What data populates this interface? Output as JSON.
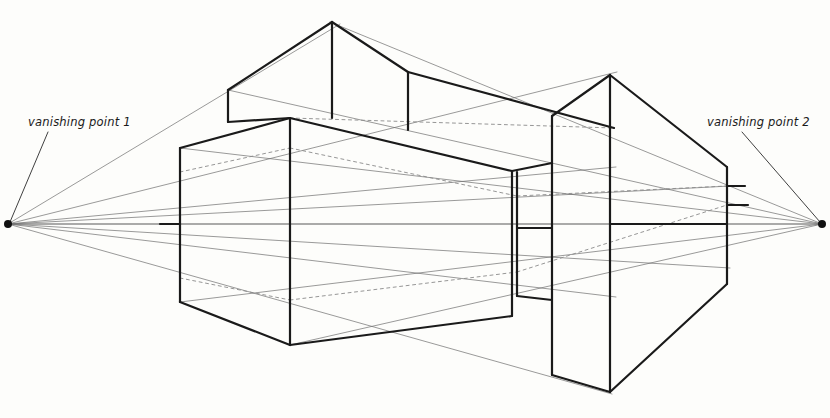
{
  "canvas": {
    "width": 830,
    "height": 418,
    "background_color": "#fdfdfb"
  },
  "style": {
    "ink_color": "#1a1a1a",
    "guide_color": "#6e6e6e",
    "hidden_color": "#8a8a8a",
    "solid_stroke_width": 2.2,
    "guide_stroke_width": 0.7,
    "hidden_stroke_width": 0.8
  },
  "labels": {
    "left": {
      "text": "vanishing point 1",
      "x": 28,
      "y": 126
    },
    "right": {
      "text": "vanishing point 2",
      "x": 707,
      "y": 126
    }
  },
  "vanishing_points": {
    "left": {
      "name": "vanishing point 1",
      "x": 8,
      "y": 224,
      "dot_radius": 4
    },
    "right": {
      "name": "vanishing point 2",
      "x": 822,
      "y": 224,
      "dot_radius": 4
    }
  },
  "leader_lines": [
    {
      "name": "left-label-leader",
      "x1": 48,
      "y1": 132,
      "x2": 10,
      "y2": 222
    },
    {
      "name": "right-label-leader",
      "x1": 742,
      "y1": 132,
      "x2": 820,
      "y2": 222
    }
  ],
  "guide_lines_left": [
    {
      "x1": 8,
      "y1": 224,
      "x2": 340,
      "y2": 24
    },
    {
      "x1": 8,
      "y1": 224,
      "x2": 617,
      "y2": 72
    },
    {
      "x1": 8,
      "y1": 224,
      "x2": 616,
      "y2": 167
    },
    {
      "x1": 8,
      "y1": 224,
      "x2": 730,
      "y2": 186
    },
    {
      "x1": 8,
      "y1": 224,
      "x2": 822,
      "y2": 224
    },
    {
      "x1": 8,
      "y1": 224,
      "x2": 730,
      "y2": 268
    },
    {
      "x1": 8,
      "y1": 224,
      "x2": 616,
      "y2": 297
    },
    {
      "x1": 8,
      "y1": 224,
      "x2": 612,
      "y2": 394
    }
  ],
  "guide_lines_right": [
    {
      "x1": 822,
      "y1": 224,
      "x2": 330,
      "y2": 22
    },
    {
      "x1": 822,
      "y1": 224,
      "x2": 228,
      "y2": 90
    },
    {
      "x1": 822,
      "y1": 224,
      "x2": 180,
      "y2": 148
    },
    {
      "x1": 822,
      "y1": 224,
      "x2": 8,
      "y2": 224
    },
    {
      "x1": 822,
      "y1": 224,
      "x2": 180,
      "y2": 302
    },
    {
      "x1": 822,
      "y1": 224,
      "x2": 290,
      "y2": 345
    }
  ],
  "solid_edges": [
    {
      "name": "upper-block-left-ridge",
      "x1": 228,
      "y1": 90,
      "x2": 332,
      "y2": 22
    },
    {
      "name": "upper-block-right-ridge",
      "x1": 332,
      "y1": 22,
      "x2": 408,
      "y2": 72
    },
    {
      "name": "upper-block-ridge-far",
      "x1": 408,
      "y1": 72,
      "x2": 614,
      "y2": 128
    },
    {
      "name": "upper-block-left-vertical",
      "x1": 228,
      "y1": 90,
      "x2": 228,
      "y2": 122
    },
    {
      "name": "upper-block-apex-vertical",
      "x1": 332,
      "y1": 22,
      "x2": 332,
      "y2": 118
    },
    {
      "name": "upper-block-right-vertical",
      "x1": 408,
      "y1": 72,
      "x2": 408,
      "y2": 130
    },
    {
      "name": "upper-block-lower-left-edge",
      "x1": 228,
      "y1": 122,
      "x2": 290,
      "y2": 118
    },
    {
      "name": "upper-block-base-left",
      "x1": 180,
      "y1": 148,
      "x2": 290,
      "y2": 118
    },
    {
      "name": "upper-block-base-right",
      "x1": 290,
      "y1": 118,
      "x2": 512,
      "y2": 171
    },
    {
      "name": "main-block-left-vertical",
      "x1": 180,
      "y1": 148,
      "x2": 180,
      "y2": 302
    },
    {
      "name": "main-block-front-vertical",
      "x1": 290,
      "y1": 118,
      "x2": 290,
      "y2": 345
    },
    {
      "name": "main-block-right-vertical",
      "x1": 512,
      "y1": 171,
      "x2": 512,
      "y2": 316
    },
    {
      "name": "main-block-bottom-left",
      "x1": 180,
      "y1": 302,
      "x2": 290,
      "y2": 345
    },
    {
      "name": "main-block-bottom-right",
      "x1": 290,
      "y1": 345,
      "x2": 512,
      "y2": 316
    },
    {
      "name": "connector-left-vertical",
      "x1": 517,
      "y1": 172,
      "x2": 517,
      "y2": 296
    },
    {
      "name": "connector-mid-horizontal",
      "x1": 517,
      "y1": 228,
      "x2": 552,
      "y2": 228
    },
    {
      "name": "connector-top-edge",
      "x1": 512,
      "y1": 171,
      "x2": 552,
      "y2": 163
    },
    {
      "name": "connector-bottom-edge",
      "x1": 517,
      "y1": 296,
      "x2": 552,
      "y2": 300
    },
    {
      "name": "right-block-top-ridge-left",
      "x1": 552,
      "y1": 116,
      "x2": 610,
      "y2": 75
    },
    {
      "name": "right-block-top-ridge-right",
      "x1": 610,
      "y1": 75,
      "x2": 727,
      "y2": 167
    },
    {
      "name": "right-block-left-vertical",
      "x1": 552,
      "y1": 116,
      "x2": 552,
      "y2": 375
    },
    {
      "name": "right-block-front-vertical",
      "x1": 610,
      "y1": 75,
      "x2": 610,
      "y2": 392
    },
    {
      "name": "right-block-right-vertical",
      "x1": 727,
      "y1": 167,
      "x2": 727,
      "y2": 284
    },
    {
      "name": "right-block-bottom-left",
      "x1": 552,
      "y1": 375,
      "x2": 610,
      "y2": 392
    },
    {
      "name": "right-block-bottom-right",
      "x1": 610,
      "y1": 392,
      "x2": 727,
      "y2": 284
    },
    {
      "name": "right-block-tick-upper",
      "x1": 727,
      "y1": 186,
      "x2": 745,
      "y2": 186
    },
    {
      "name": "right-block-tick-lower",
      "x1": 727,
      "y1": 205,
      "x2": 748,
      "y2": 205
    },
    {
      "name": "right-block-center-horizontal",
      "x1": 610,
      "y1": 224,
      "x2": 727,
      "y2": 224
    },
    {
      "name": "left-tick-upper",
      "x1": 160,
      "y1": 224,
      "x2": 180,
      "y2": 224
    }
  ],
  "hidden_edges": [
    {
      "name": "hidden-top-back-left",
      "x1": 180,
      "y1": 172,
      "x2": 290,
      "y2": 148
    },
    {
      "name": "hidden-top-back-right",
      "x1": 290,
      "y1": 148,
      "x2": 517,
      "y2": 196
    },
    {
      "name": "hidden-top-back-extend",
      "x1": 517,
      "y1": 196,
      "x2": 727,
      "y2": 186
    },
    {
      "name": "hidden-bottom-back-left",
      "x1": 180,
      "y1": 278,
      "x2": 290,
      "y2": 300
    },
    {
      "name": "hidden-bottom-back-right",
      "x1": 290,
      "y1": 300,
      "x2": 517,
      "y2": 272
    },
    {
      "name": "hidden-bottom-back-extend",
      "x1": 517,
      "y1": 272,
      "x2": 727,
      "y2": 205
    },
    {
      "name": "hidden-upper-block-back",
      "x1": 290,
      "y1": 118,
      "x2": 614,
      "y2": 128
    }
  ]
}
